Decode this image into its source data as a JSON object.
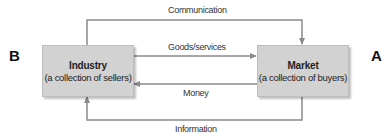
{
  "diagram": {
    "type": "flow",
    "left_letter": "B",
    "right_letter": "A",
    "nodes": {
      "industry": {
        "title": "Industry",
        "subtitle": "(a collection of sellers)"
      },
      "market": {
        "title": "Market",
        "subtitle": "(a collection of buyers)"
      }
    },
    "flows": {
      "communication": {
        "label": "Communication",
        "from": "Industry",
        "to": "Market"
      },
      "goods": {
        "label": "Goods/services",
        "from": "Industry",
        "to": "Market"
      },
      "money": {
        "label": "Money",
        "from": "Market",
        "to": "Industry"
      },
      "information": {
        "label": "Information",
        "from": "Market",
        "to": "Industry"
      }
    },
    "colors": {
      "box_fill": "#d2d2d2",
      "line": "#8a8a8a",
      "text": "#222222"
    }
  }
}
